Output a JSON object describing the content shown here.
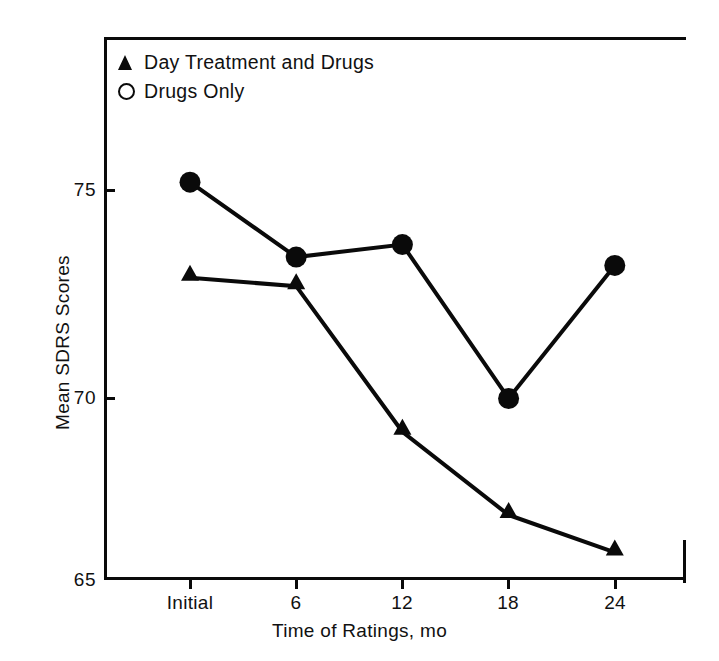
{
  "chart_data": {
    "type": "line",
    "title": "",
    "xlabel": "Time of Ratings, mo",
    "ylabel": "Mean SDRS Scores",
    "categories": [
      "Initial",
      "6",
      "12",
      "18",
      "24"
    ],
    "x_tick_labels": [
      "Initial",
      "6",
      "12",
      "18",
      "24"
    ],
    "y_tick_labels": [
      "75",
      "70",
      "65"
    ],
    "y_ticks": [
      75,
      70,
      65
    ],
    "ylim": [
      65,
      76.4
    ],
    "grid": false,
    "legend_position": "top-left",
    "series": [
      {
        "name": "Day Treatment and Drugs",
        "marker": "triangle-filled",
        "color": "#0a0a0a",
        "values": [
          72.9,
          72.7,
          69.2,
          67.2,
          66.3
        ]
      },
      {
        "name": "Drugs Only",
        "marker": "circle",
        "legend_marker": "circle-open",
        "color": "#0a0a0a",
        "values": [
          75.2,
          73.4,
          73.7,
          70.0,
          73.2
        ]
      }
    ]
  },
  "axes": {
    "y_title": "Mean SDRS Scores",
    "x_title": "Time of Ratings, mo",
    "y_tick_0": "75",
    "y_tick_1": "70",
    "y_tick_2": "65",
    "x_tick_0": "Initial",
    "x_tick_1": "6",
    "x_tick_2": "12",
    "x_tick_3": "18",
    "x_tick_4": "24"
  },
  "legend": {
    "items": [
      {
        "label": "Day Treatment and Drugs",
        "marker": "triangle-filled"
      },
      {
        "label": "Drugs Only",
        "marker": "circle-open"
      }
    ],
    "item_0_label": "Day Treatment and Drugs",
    "item_1_label": "Drugs Only"
  },
  "colors": {
    "ink": "#0a0a0a",
    "background": "#ffffff"
  }
}
